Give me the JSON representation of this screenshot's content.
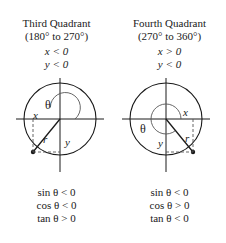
{
  "figure": {
    "stroke_color": "#1a1a1a",
    "dash_color": "#555555"
  },
  "panels": [
    {
      "id": "third-quadrant",
      "title": "Third Quadrant",
      "range": "(180° to 270°)",
      "x_sign": "x < 0",
      "y_sign": "y < 0",
      "labels": {
        "theta": "θ",
        "x": "x",
        "y": "y",
        "r": "r"
      },
      "signs": [
        "sin θ < 0",
        "cos θ < 0",
        "tan θ > 0"
      ],
      "geometry": {
        "center_x": 60,
        "center_y": 49,
        "outer_radius": 36,
        "inner_arc_radius": 15,
        "terminal_x": 33,
        "terminal_y": 82,
        "angle_degrees": 230
      }
    },
    {
      "id": "fourth-quadrant",
      "title": "Fourth Quadrant",
      "range": "(270° to 360°)",
      "x_sign": "x > 0",
      "y_sign": "y < 0",
      "labels": {
        "theta": "θ",
        "x": "x",
        "y": "y",
        "r": "r"
      },
      "signs": [
        "sin θ < 0",
        "cos θ > 0",
        "tan θ < 0"
      ],
      "geometry": {
        "center_x": 53,
        "center_y": 49,
        "outer_radius": 36,
        "inner_arc_radius": 15,
        "terminal_x": 80,
        "terminal_y": 82,
        "angle_degrees": 310
      }
    }
  ]
}
